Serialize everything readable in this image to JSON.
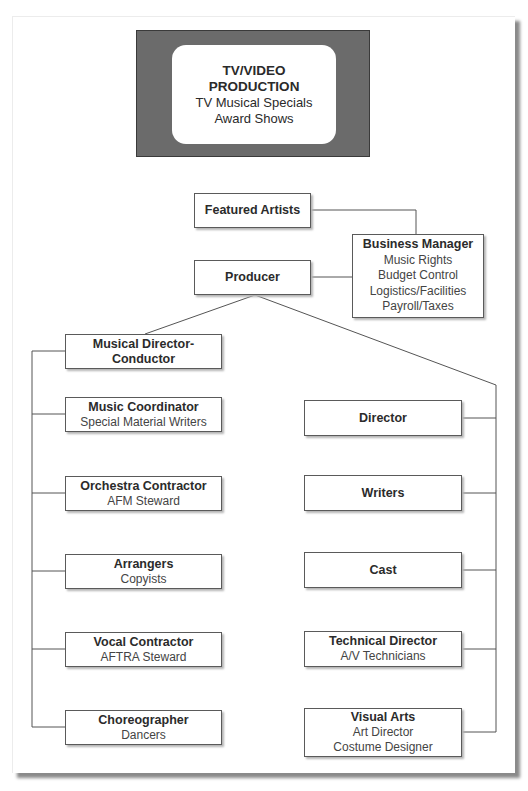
{
  "banner": {
    "title_line1": "TV/VIDEO",
    "title_line2": "PRODUCTION",
    "subtitle_line1": "TV Musical Specials",
    "subtitle_line2": "Award Shows"
  },
  "top_nodes": {
    "featured_artists": {
      "title": "Featured Artists"
    },
    "producer": {
      "title": "Producer"
    },
    "business_manager": {
      "title": "Business Manager",
      "items": [
        "Music Rights",
        "Budget Control",
        "Logistics/Facilities",
        "Payroll/Taxes"
      ]
    }
  },
  "left_branch": [
    {
      "title": "Musical Director-",
      "title2": "Conductor",
      "sub": []
    },
    {
      "title": "Music Coordinator",
      "sub": [
        "Special Material Writers"
      ]
    },
    {
      "title": "Orchestra Contractor",
      "sub": [
        "AFM Steward"
      ]
    },
    {
      "title": "Arrangers",
      "sub": [
        "Copyists"
      ]
    },
    {
      "title": "Vocal Contractor",
      "sub": [
        "AFTRA Steward"
      ]
    },
    {
      "title": "Choreographer",
      "sub": [
        "Dancers"
      ]
    }
  ],
  "right_branch": [
    {
      "title": "Director",
      "sub": []
    },
    {
      "title": "Writers",
      "sub": []
    },
    {
      "title": "Cast",
      "sub": []
    },
    {
      "title": "Technical Director",
      "sub": [
        "A/V Technicians"
      ]
    },
    {
      "title": "Visual Arts",
      "sub": [
        "Art Director",
        "Costume Designer"
      ]
    }
  ]
}
